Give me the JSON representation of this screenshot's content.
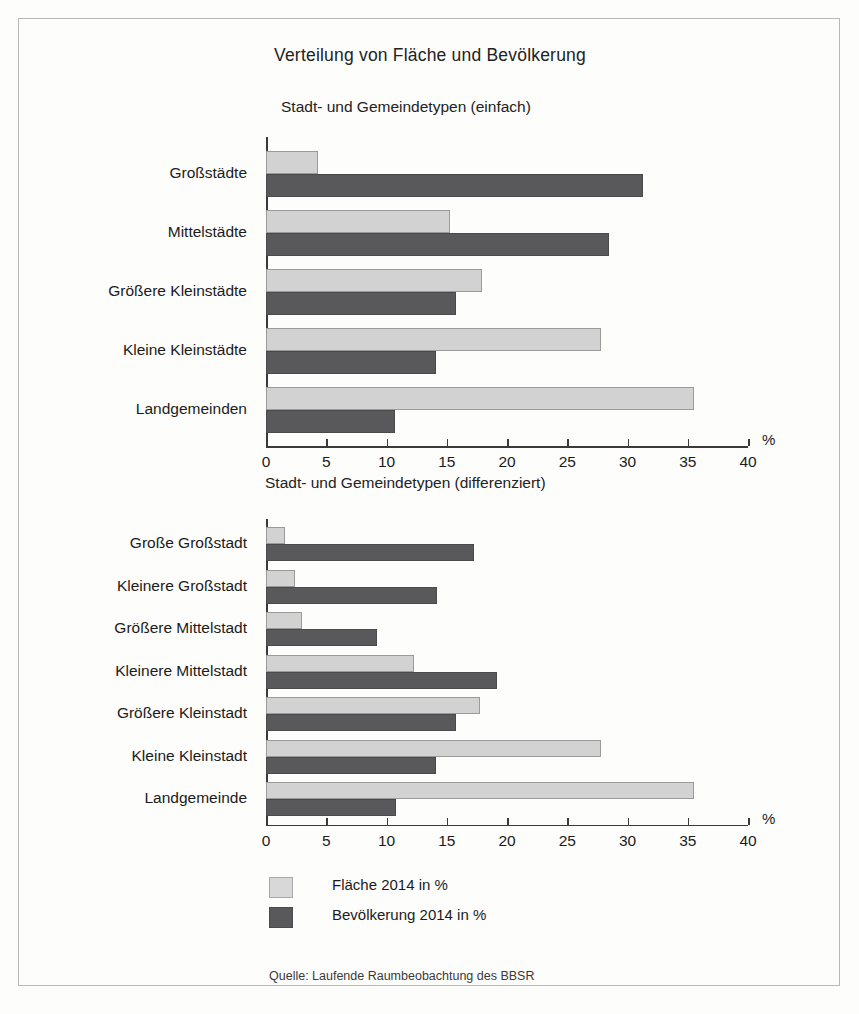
{
  "figure": {
    "title": "Verteilung von Fläche und Bevölkerung",
    "source": "Quelle: Laufende Raumbeobachtung des BBSR"
  },
  "legend": {
    "items": [
      {
        "label": "Fläche 2014 in %",
        "color": "#d8d8d8",
        "key": "flaeche"
      },
      {
        "label": "Bevölkerung 2014 in %",
        "color": "#59595b",
        "key": "bev"
      }
    ]
  },
  "axis": {
    "ticks": [
      "0",
      "5",
      "10",
      "15",
      "20",
      "25",
      "30",
      "35",
      "40"
    ],
    "unit": "%",
    "min": 0,
    "max": 40
  },
  "chart_data": [
    {
      "type": "bar",
      "orientation": "horizontal",
      "title": "Stadt- und Gemeindetypen (einfach)",
      "xlabel": "%",
      "ylabel": "",
      "xlim": [
        0,
        40
      ],
      "grid": false,
      "legend_position": "bottom",
      "categories": [
        "Großstädte",
        "Mittelstädte",
        "Größere Kleinstädte",
        "Kleine Kleinstädte",
        "Landgemeinden"
      ],
      "series": [
        {
          "name": "Fläche 2014 in %",
          "values": [
            4.3,
            15.3,
            17.9,
            27.8,
            35.5
          ]
        },
        {
          "name": "Bevölkerung 2014 in %",
          "values": [
            31.3,
            28.5,
            15.8,
            14.1,
            10.7
          ]
        }
      ]
    },
    {
      "type": "bar",
      "orientation": "horizontal",
      "title": "Stadt- und Gemeindetypen (differenziert)",
      "xlabel": "%",
      "ylabel": "",
      "xlim": [
        0,
        40
      ],
      "grid": false,
      "legend_position": "bottom",
      "categories": [
        "Große Großstadt",
        "Kleinere Großstadt",
        "Größere Mittelstadt",
        "Kleinere Mittelstadt",
        "Größere Kleinstadt",
        "Kleine Kleinstadt",
        "Landgemeinde"
      ],
      "series": [
        {
          "name": "Fläche 2014 in %",
          "values": [
            1.6,
            2.4,
            3.0,
            12.3,
            17.8,
            27.8,
            35.5
          ]
        },
        {
          "name": "Bevölkerung 2014 in %",
          "values": [
            17.3,
            14.2,
            9.2,
            19.2,
            15.8,
            14.1,
            10.8
          ]
        }
      ]
    }
  ]
}
